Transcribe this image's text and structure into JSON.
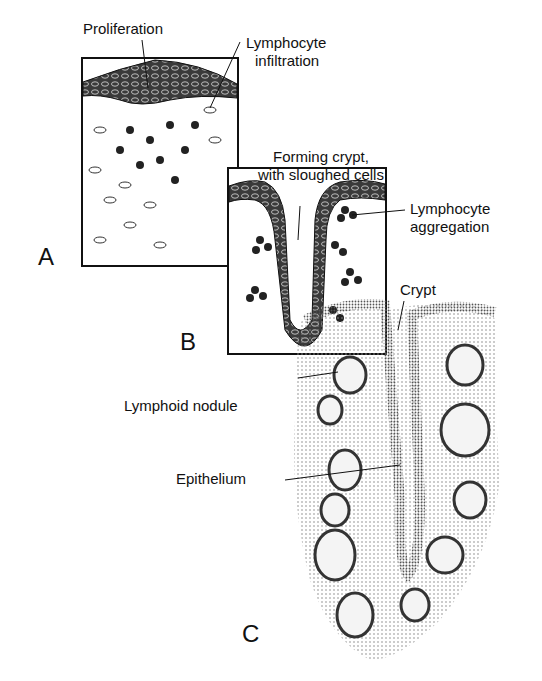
{
  "figure": {
    "panels": [
      {
        "id": "A",
        "letter": "A"
      },
      {
        "id": "B",
        "letter": "B"
      },
      {
        "id": "C",
        "letter": "C"
      }
    ],
    "labels": {
      "proliferation": "Proliferation",
      "lymphocyte_infiltration_1": "Lymphocyte",
      "lymphocyte_infiltration_2": "infiltration",
      "forming_crypt_1": "Forming crypt,",
      "forming_crypt_2": "with sloughed cells",
      "lymphocyte_aggregation_1": "Lymphocyte",
      "lymphocyte_aggregation_2": "aggregation",
      "crypt": "Crypt",
      "lymphoid_nodule": "Lymphoid nodule",
      "epithelium": "Epithelium"
    },
    "colors": {
      "ink": "#111111",
      "stipple": "#9a9a9a",
      "background": "#ffffff"
    }
  }
}
